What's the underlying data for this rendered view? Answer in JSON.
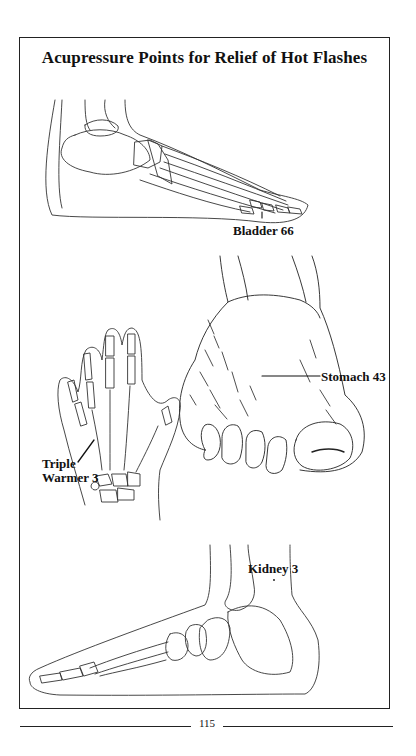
{
  "page": {
    "title": "Acupressure Points for Relief of Hot Flashes",
    "page_number": "115"
  },
  "illustrations": [
    {
      "name": "foot-skeleton-lateral",
      "label": "Bladder 66"
    },
    {
      "name": "foot-top-view",
      "label": "Stomach 43"
    },
    {
      "name": "hand-skeleton",
      "label_line1": "Triple",
      "label_line2": "Warmer 3"
    },
    {
      "name": "foot-skeleton-medial",
      "label": "Kidney 3"
    }
  ],
  "colors": {
    "ink": "#222222",
    "paper": "#ffffff"
  }
}
